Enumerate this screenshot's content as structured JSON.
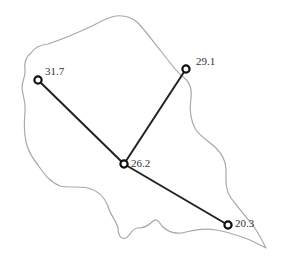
{
  "diagram": {
    "type": "network-on-region",
    "region_outline_color": "#a8a8a8",
    "edge_color": "#222222",
    "node_stroke_color": "#111111",
    "nodes": [
      {
        "id": "n1",
        "label": "31.7",
        "x": 38,
        "y": 80
      },
      {
        "id": "n2",
        "label": "29.1",
        "x": 186,
        "y": 69
      },
      {
        "id": "n3",
        "label": "26.2",
        "x": 124,
        "y": 164
      },
      {
        "id": "n4",
        "label": "20.3",
        "x": 228,
        "y": 225
      }
    ],
    "edges": [
      {
        "from": "n1",
        "to": "n3"
      },
      {
        "from": "n2",
        "to": "n3"
      },
      {
        "from": "n3",
        "to": "n4"
      }
    ]
  }
}
